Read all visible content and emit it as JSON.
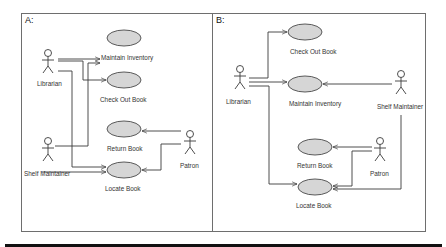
{
  "colors": {
    "use_case_fill": "#d6d6d6",
    "stroke": "#3a3a3a",
    "panel_border": "#6e6e6e",
    "bottom_bar": "#111111"
  },
  "panels": [
    {
      "id": "A",
      "label": "A:",
      "actors": [
        {
          "name": "Librarian"
        },
        {
          "name": "Shelf Maintainer"
        },
        {
          "name": "Patron"
        }
      ],
      "use_cases": [
        {
          "name": "Maintain Inventory"
        },
        {
          "name": "Check Out Book"
        },
        {
          "name": "Return Book"
        },
        {
          "name": "Locate Book"
        }
      ],
      "associations": [
        {
          "from": "Librarian",
          "to": "Maintain Inventory"
        },
        {
          "from": "Librarian",
          "to": "Check Out Book"
        },
        {
          "from": "Librarian",
          "to": "Locate Book"
        },
        {
          "from": "Shelf Maintainer",
          "to": "Maintain Inventory"
        },
        {
          "from": "Shelf Maintainer",
          "to": "Locate Book"
        },
        {
          "from": "Patron",
          "to": "Return Book"
        },
        {
          "from": "Patron",
          "to": "Locate Book"
        }
      ]
    },
    {
      "id": "B",
      "label": "B:",
      "actors": [
        {
          "name": "Librarian"
        },
        {
          "name": "Shelf Maintainer"
        },
        {
          "name": "Patron"
        }
      ],
      "use_cases": [
        {
          "name": "Check Out Book"
        },
        {
          "name": "Maintain Inventory"
        },
        {
          "name": "Return Book"
        },
        {
          "name": "Locate Book"
        }
      ],
      "associations": [
        {
          "from": "Librarian",
          "to": "Check Out Book"
        },
        {
          "from": "Librarian",
          "to": "Maintain Inventory"
        },
        {
          "from": "Librarian",
          "to": "Locate Book"
        },
        {
          "from": "Shelf Maintainer",
          "to": "Maintain Inventory"
        },
        {
          "from": "Shelf Maintainer",
          "to": "Locate Book"
        },
        {
          "from": "Patron",
          "to": "Return Book"
        },
        {
          "from": "Patron",
          "to": "Locate Book"
        }
      ]
    }
  ]
}
